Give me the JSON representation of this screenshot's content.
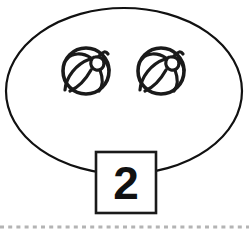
{
  "card": {
    "title": "Counting card: two beach balls",
    "background_color": "#ffffff",
    "width": 249,
    "height": 234
  },
  "group_outline": {
    "name": "ellipse-grouping-ring",
    "shape": "ellipse",
    "center_x": 124,
    "center_y": 91,
    "radius_x": 118,
    "radius_y": 83,
    "stroke_color": "#111111",
    "stroke_width": 2.2,
    "fill": "none"
  },
  "objects": {
    "label": "beach-ball",
    "count": 2,
    "fill_color": "#ffffff",
    "stroke_color": "#1a1a1a",
    "items": [
      {
        "name": "beach-ball-1",
        "center_x": 86,
        "center_y": 71,
        "radius": 24
      },
      {
        "name": "beach-ball-2",
        "center_x": 161,
        "center_y": 71,
        "radius": 24
      }
    ]
  },
  "count_box": {
    "name": "count-box",
    "value": "2",
    "x": 96,
    "y": 152,
    "width": 60,
    "height": 61,
    "fill_color": "#ffffff",
    "border_color": "#1a1a1a",
    "text_color": "#111111"
  },
  "baseline": {
    "name": "dashed-baseline",
    "y": 227,
    "x_start": 0,
    "x_end": 249,
    "color": "#b4b4b4",
    "style": "dashed"
  }
}
